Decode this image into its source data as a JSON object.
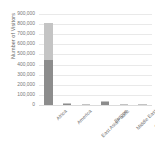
{
  "chart_data": {
    "type": "bar",
    "subtype": "stacked-bar",
    "title": "",
    "xlabel": "",
    "ylabel": "Number of Visitors",
    "categories": [
      "Africa",
      "America",
      "East Asia/Pacific",
      "Europe",
      "Middle East",
      "South Asia"
    ],
    "series": [
      {
        "name": "series-1",
        "color": "#8c8c8c",
        "values": [
          450000,
          18000,
          6000,
          30000,
          1500,
          5000
        ]
      },
      {
        "name": "series-2",
        "color": "#c4c4c4",
        "values": [
          360000,
          4000,
          2000,
          8000,
          500,
          1000
        ]
      }
    ],
    "totals": [
      810000,
      22000,
      8000,
      38000,
      2000,
      6000
    ],
    "ylim": [
      0,
      900000
    ],
    "ytick_values": [
      0,
      100000,
      200000,
      300000,
      400000,
      500000,
      600000,
      700000,
      800000,
      900000
    ],
    "ytick_labels": [
      "0",
      "100,000",
      "200,000",
      "300,000",
      "400,000",
      "500,000",
      "600,000",
      "700,000",
      "800,000",
      "900,000"
    ],
    "grid": "horizontal",
    "legend": "none",
    "xtick_rotation": -45
  },
  "colors": {
    "background": "#ffffff",
    "gridline": "#e9e9e9",
    "axis_text": "#777777",
    "label_text": "#6f6f6f",
    "bar_dark": "#8c8c8c",
    "bar_light": "#c4c4c4"
  }
}
